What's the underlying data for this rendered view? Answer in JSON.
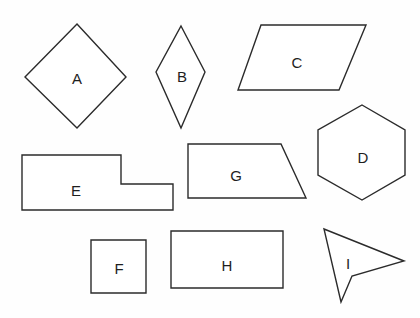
{
  "worksheet": {
    "title": "Polygon identification worksheet",
    "width": 420,
    "height": 318,
    "background_color": "#fefefe",
    "stroke_color": "#2b2b2b",
    "fill_color": "#ffffff",
    "label_color": "#1e1e1e"
  },
  "shapes": [
    {
      "id": "shape-a",
      "label": "A",
      "kind": "square-diamond",
      "sides": 4,
      "points": "77,24 126,77 77,128 25,77",
      "label_x": 77,
      "label_y": 78
    },
    {
      "id": "shape-b",
      "label": "B",
      "kind": "rhombus",
      "sides": 4,
      "points": "181,26 205,72 181,128 156,72",
      "label_x": 182,
      "label_y": 76
    },
    {
      "id": "shape-c",
      "label": "C",
      "kind": "parallelogram",
      "sides": 4,
      "points": "261,25 366,25 339,90 238,90",
      "label_x": 297,
      "label_y": 62
    },
    {
      "id": "shape-d",
      "label": "D",
      "kind": "hexagon",
      "sides": 6,
      "points": "362,105 405,130 405,175 362,200 318,175 318,130",
      "label_x": 363,
      "label_y": 157
    },
    {
      "id": "shape-e",
      "label": "E",
      "kind": "l-shaped-hexagon",
      "sides": 6,
      "points": "22,155 121,155 121,184 173,184 173,210 22,210",
      "label_x": 76,
      "label_y": 190
    },
    {
      "id": "shape-f",
      "label": "F",
      "kind": "square",
      "sides": 4,
      "points": "91,240 146,240 146,293 91,293",
      "label_x": 119,
      "label_y": 268
    },
    {
      "id": "shape-g",
      "label": "G",
      "kind": "trapezoid",
      "sides": 4,
      "points": "188,144 281,144 306,198 188,198",
      "label_x": 236,
      "label_y": 175
    },
    {
      "id": "shape-h",
      "label": "H",
      "kind": "rectangle",
      "sides": 4,
      "points": "171,231 283,231 283,288 171,288",
      "label_x": 227,
      "label_y": 265
    },
    {
      "id": "shape-i",
      "label": "I",
      "kind": "concave-dart",
      "sides": 4,
      "points": "324,229 404,261 352,276 341,302",
      "label_x": 348,
      "label_y": 263
    }
  ]
}
